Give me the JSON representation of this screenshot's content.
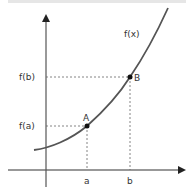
{
  "diagram": {
    "curve_label": "f(x)",
    "points": [
      {
        "label": "A",
        "x_label": "a",
        "y_label": "f(a)"
      },
      {
        "label": "B",
        "x_label": "b",
        "y_label": "f(b)"
      }
    ],
    "colors": {
      "axis": "#333333",
      "curve": "#555555",
      "guide": "#666666",
      "point": "#111111"
    }
  }
}
